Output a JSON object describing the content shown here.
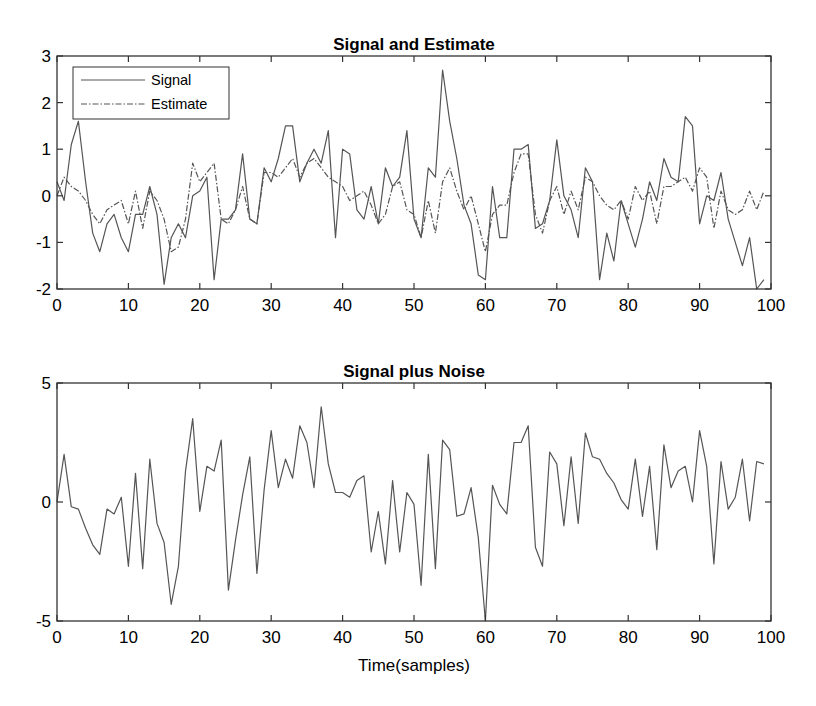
{
  "chart_data": [
    {
      "type": "line",
      "title": "Signal and Estimate",
      "xlabel": "",
      "ylabel": "",
      "xlim": [
        0,
        100
      ],
      "ylim": [
        -2,
        3
      ],
      "xticks": [
        0,
        10,
        20,
        30,
        40,
        50,
        60,
        70,
        80,
        90,
        100
      ],
      "yticks": [
        -2,
        -1,
        0,
        1,
        2,
        3
      ],
      "grid": false,
      "legend": {
        "position": "upper-left",
        "entries": [
          "Signal",
          "Estimate"
        ]
      },
      "x": [
        0,
        1,
        2,
        3,
        4,
        5,
        6,
        7,
        8,
        9,
        10,
        11,
        12,
        13,
        14,
        15,
        16,
        17,
        18,
        19,
        20,
        21,
        22,
        23,
        24,
        25,
        26,
        27,
        28,
        29,
        30,
        31,
        32,
        33,
        34,
        35,
        36,
        37,
        38,
        39,
        40,
        41,
        42,
        43,
        44,
        45,
        46,
        47,
        48,
        49,
        50,
        51,
        52,
        53,
        54,
        55,
        56,
        57,
        58,
        59,
        60,
        61,
        62,
        63,
        64,
        65,
        66,
        67,
        68,
        69,
        70,
        71,
        72,
        73,
        74,
        75,
        76,
        77,
        78,
        79,
        80,
        81,
        82,
        83,
        84,
        85,
        86,
        87,
        88,
        89,
        90,
        91,
        92,
        93,
        94,
        95,
        96,
        97,
        98,
        99
      ],
      "series": [
        {
          "name": "Signal",
          "style": "solid",
          "values": [
            0.3,
            -0.1,
            1.1,
            1.6,
            0.3,
            -0.8,
            -1.2,
            -0.6,
            -0.4,
            -0.9,
            -1.2,
            -0.4,
            -0.4,
            0.2,
            -0.4,
            -1.9,
            -0.9,
            -0.6,
            -0.9,
            0.0,
            0.1,
            0.4,
            -1.8,
            -0.5,
            -0.5,
            -0.3,
            0.9,
            -0.5,
            -0.6,
            0.6,
            0.3,
            0.8,
            1.5,
            1.5,
            0.3,
            0.7,
            1.0,
            0.7,
            1.4,
            -0.9,
            1.0,
            0.9,
            -0.3,
            -0.5,
            0.2,
            -0.6,
            0.6,
            0.2,
            0.4,
            1.4,
            -0.5,
            -0.9,
            0.6,
            0.4,
            2.7,
            1.6,
            0.8,
            -0.2,
            -0.6,
            -1.7,
            -1.8,
            0.2,
            -0.9,
            -0.9,
            1.0,
            1.0,
            1.1,
            -0.7,
            -0.6,
            -0.1,
            1.2,
            0.0,
            -0.3,
            -0.9,
            0.6,
            0.3,
            -1.8,
            -0.8,
            -1.4,
            -0.1,
            -0.6,
            -1.1,
            -0.5,
            0.3,
            -0.1,
            0.8,
            0.4,
            0.3,
            1.7,
            1.5,
            -0.6,
            0.0,
            -0.1,
            0.5,
            -0.5,
            -1.0,
            -1.5,
            -0.9,
            -2.0,
            -1.8
          ]
        },
        {
          "name": "Estimate",
          "style": "dashdot",
          "values": [
            0.0,
            0.4,
            0.2,
            0.1,
            -0.1,
            -0.4,
            -0.6,
            -0.3,
            -0.2,
            -0.1,
            -0.6,
            0.1,
            -0.7,
            0.1,
            -0.1,
            -0.5,
            -1.2,
            -1.1,
            -0.5,
            0.7,
            0.3,
            0.5,
            0.7,
            -0.5,
            -0.6,
            -0.3,
            0.2,
            -0.5,
            -0.6,
            0.5,
            0.5,
            0.4,
            0.6,
            0.8,
            0.4,
            0.7,
            0.8,
            0.6,
            0.4,
            0.3,
            0.2,
            -0.1,
            0.0,
            0.1,
            -0.2,
            -0.6,
            -0.4,
            0.2,
            0.3,
            -0.3,
            -0.4,
            -0.9,
            -0.1,
            -0.8,
            0.3,
            0.6,
            0.1,
            -0.3,
            0.0,
            -0.6,
            -1.2,
            -0.4,
            -0.2,
            -0.2,
            0.5,
            0.9,
            0.9,
            -0.4,
            -0.8,
            -0.1,
            0.2,
            -0.4,
            0.1,
            -0.3,
            0.4,
            0.3,
            0.0,
            -0.2,
            -0.3,
            -0.1,
            -0.5,
            0.2,
            -0.1,
            0.1,
            -0.6,
            0.2,
            0.2,
            0.3,
            0.4,
            0.1,
            0.6,
            0.4,
            -0.7,
            0.1,
            -0.3,
            -0.4,
            -0.3,
            0.1,
            -0.3,
            0.1
          ]
        }
      ]
    },
    {
      "type": "line",
      "title": "Signal plus Noise",
      "xlabel": "Time(samples)",
      "ylabel": "",
      "xlim": [
        0,
        100
      ],
      "ylim": [
        -5,
        5
      ],
      "xticks": [
        0,
        10,
        20,
        30,
        40,
        50,
        60,
        70,
        80,
        90,
        100
      ],
      "yticks": [
        -5,
        0,
        5
      ],
      "grid": false,
      "x": [
        0,
        1,
        2,
        3,
        4,
        5,
        6,
        7,
        8,
        9,
        10,
        11,
        12,
        13,
        14,
        15,
        16,
        17,
        18,
        19,
        20,
        21,
        22,
        23,
        24,
        25,
        26,
        27,
        28,
        29,
        30,
        31,
        32,
        33,
        34,
        35,
        36,
        37,
        38,
        39,
        40,
        41,
        42,
        43,
        44,
        45,
        46,
        47,
        48,
        49,
        50,
        51,
        52,
        53,
        54,
        55,
        56,
        57,
        58,
        59,
        60,
        61,
        62,
        63,
        64,
        65,
        66,
        67,
        68,
        69,
        70,
        71,
        72,
        73,
        74,
        75,
        76,
        77,
        78,
        79,
        80,
        81,
        82,
        83,
        84,
        85,
        86,
        87,
        88,
        89,
        90,
        91,
        92,
        93,
        94,
        95,
        96,
        97,
        98,
        99
      ],
      "series": [
        {
          "name": "Signal plus Noise",
          "style": "solid",
          "values": [
            0.0,
            2.0,
            -0.2,
            -0.3,
            -1.1,
            -1.8,
            -2.2,
            -0.3,
            -0.5,
            0.2,
            -2.7,
            1.2,
            -2.8,
            1.8,
            -0.9,
            -1.7,
            -4.3,
            -2.7,
            1.3,
            3.5,
            -0.4,
            1.5,
            1.3,
            2.6,
            -3.7,
            -1.6,
            0.3,
            1.9,
            -3.0,
            0.5,
            3.0,
            0.6,
            1.8,
            1.0,
            3.2,
            2.5,
            0.6,
            4.0,
            1.6,
            0.4,
            0.4,
            0.2,
            0.9,
            1.1,
            -2.1,
            -0.4,
            -2.6,
            0.9,
            -2.1,
            0.4,
            -0.1,
            -3.5,
            2.0,
            -2.8,
            2.6,
            2.2,
            -0.6,
            -0.5,
            0.6,
            -1.5,
            -5.0,
            0.7,
            -0.1,
            -0.5,
            2.5,
            2.5,
            3.2,
            -1.9,
            -2.7,
            2.1,
            1.6,
            -1.0,
            1.9,
            -0.9,
            2.9,
            1.9,
            1.8,
            1.2,
            0.8,
            0.1,
            -0.3,
            1.8,
            -0.6,
            1.5,
            -2.0,
            2.4,
            0.6,
            1.3,
            1.5,
            0.0,
            3.0,
            1.5,
            -2.6,
            1.7,
            -0.3,
            0.2,
            1.8,
            -0.8,
            1.7,
            1.6
          ]
        }
      ]
    }
  ]
}
